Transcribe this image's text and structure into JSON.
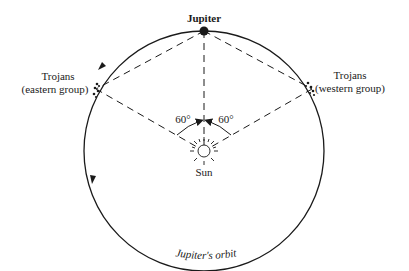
{
  "diagram": {
    "labels": {
      "jupiter": "Jupiter",
      "trojans_east_title": "Trojans",
      "trojans_east_sub": "(eastern group)",
      "trojans_west_title": "Trojans",
      "trojans_west_sub": "(western group)",
      "angle_left": "60°",
      "angle_right": "60°",
      "sun": "Sun",
      "orbit": "Jupiter's orbit"
    },
    "colors": {
      "line": "#1a1a1a",
      "background": "#ffffff"
    }
  }
}
